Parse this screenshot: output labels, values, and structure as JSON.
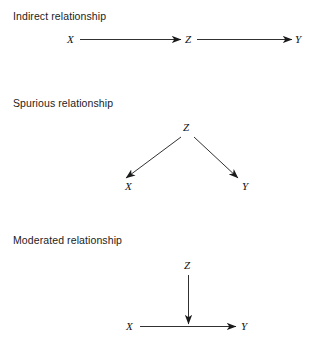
{
  "figure": {
    "background_color": "#ffffff",
    "line_color": "#1a1a1a",
    "text_color": "#1c1c1c"
  },
  "sections": [
    {
      "id": "indirect",
      "label": "Indirect relationship",
      "nodes": {
        "left": "X",
        "middle": "Z",
        "right": "Y"
      },
      "description": "X points to Z, Z points to Y"
    },
    {
      "id": "spurious",
      "label": "Spurious relationship",
      "nodes": {
        "top": "Z",
        "left": "X",
        "right": "Y"
      },
      "description": "Z points down-left to X and down-right to Y"
    },
    {
      "id": "moderated",
      "label": "Moderated relationship",
      "nodes": {
        "top": "Z",
        "left": "X",
        "right": "Y"
      },
      "description": "Z points straight down onto the arrow running from X to Y"
    }
  ]
}
